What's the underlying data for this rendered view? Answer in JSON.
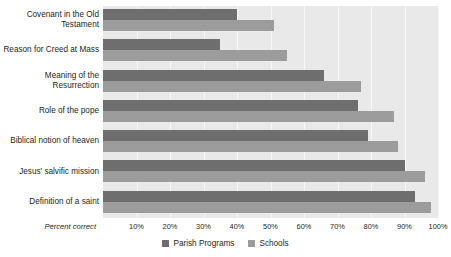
{
  "chart_data": {
    "type": "bar",
    "orientation": "horizontal",
    "title": "",
    "xlabel": "Percent correct",
    "ylabel": "",
    "xlim": [
      0,
      100
    ],
    "xticks": [
      "10%",
      "20%",
      "30%",
      "40%",
      "50%",
      "60%",
      "70%",
      "80%",
      "90%",
      "100%"
    ],
    "xtick_values": [
      10,
      20,
      30,
      40,
      50,
      60,
      70,
      80,
      90,
      100
    ],
    "grid": true,
    "legend_position": "bottom",
    "categories": [
      "Covenant in the Old Testament",
      "Reason for Creed at Mass",
      "Meaning of the Resurrection",
      "Role of the pope",
      "Biblical notion of heaven",
      "Jesus' salvific mission",
      "Definition of a saint"
    ],
    "series": [
      {
        "name": "Parish Programs",
        "color": "#6e6e6e",
        "values": [
          40,
          35,
          66,
          76,
          79,
          90,
          93
        ]
      },
      {
        "name": "Schools",
        "color": "#9c9c9c",
        "values": [
          51,
          55,
          77,
          87,
          88,
          96,
          98
        ]
      }
    ]
  },
  "axis": {
    "title": "Percent correct",
    "ticks": [
      "10%",
      "20%",
      "30%",
      "40%",
      "50%",
      "60%",
      "70%",
      "80%",
      "90%",
      "100%"
    ]
  },
  "category_labels": [
    [
      "Covenant in the Old",
      "Testament"
    ],
    [
      "Reason for Creed at Mass"
    ],
    [
      "Meaning of the",
      "Resurrection"
    ],
    [
      "Role of the pope"
    ],
    [
      "Biblical notion of heaven"
    ],
    [
      "Jesus' salvific mission"
    ],
    [
      "Definition of a saint"
    ]
  ],
  "legend": {
    "items": [
      {
        "label": "Parish Programs",
        "color": "#6e6e6e"
      },
      {
        "label": "Schools",
        "color": "#9c9c9c"
      }
    ]
  },
  "colors": {
    "parish": "#6e6e6e",
    "schools": "#9c9c9c",
    "plot_background": "#e9e9e9",
    "gridline": "#f7f7f7",
    "text": "#231f20"
  }
}
